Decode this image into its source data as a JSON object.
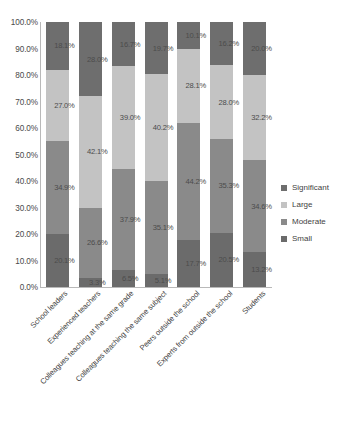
{
  "chart_data": {
    "type": "bar",
    "title": "",
    "xlabel": "",
    "ylabel": "",
    "ylim": [
      0,
      100
    ],
    "grid": false,
    "stacked": true,
    "stack_mode": "percent",
    "legend_position": "right",
    "yticks": [
      "100.0%",
      "90.0%",
      "80.0%",
      "70.0%",
      "60.0%",
      "50.0%",
      "40.0%",
      "30.0%",
      "20.0%",
      "10.0%",
      "0.0%"
    ],
    "categories": [
      "School leaders",
      "Experienced teachers",
      "Colleagues teaching at the same grade",
      "Colleagues teaching the same subject",
      "Peers outside the school",
      "Experts from outside the school",
      "Students"
    ],
    "series": [
      {
        "name": "Significant",
        "color": "#6e6e6e",
        "values": [
          18.1,
          28.0,
          16.7,
          19.7,
          10.1,
          16.2,
          20.0
        ],
        "labels": [
          "18.1%",
          "28.0%",
          "16.7%",
          "19.7%",
          "10.1%",
          "16.2%",
          "20.0%"
        ]
      },
      {
        "name": "Large",
        "color": "#c3c3c3",
        "values": [
          27.0,
          42.1,
          39.0,
          40.2,
          28.1,
          28.0,
          32.2
        ],
        "labels": [
          "27.0%",
          "42.1%",
          "39.0%",
          "40.2%",
          "28.1%",
          "28.0%",
          "32.2%"
        ]
      },
      {
        "name": "Moderate",
        "color": "#8a8a8a",
        "values": [
          34.9,
          26.6,
          37.9,
          35.1,
          44.2,
          35.3,
          34.6
        ],
        "labels": [
          "34.9%",
          "26.6%",
          "37.9%",
          "35.1%",
          "44.2%",
          "35.3%",
          "34.6%"
        ]
      },
      {
        "name": "Small",
        "color": "#6b6b6b",
        "values": [
          20.1,
          3.3,
          6.5,
          5.1,
          17.7,
          20.5,
          13.2
        ],
        "labels": [
          "20.1%",
          "3.3%",
          "6.5%",
          "5.1%",
          "17.7%",
          "20.5%",
          "13.2%"
        ]
      }
    ]
  }
}
